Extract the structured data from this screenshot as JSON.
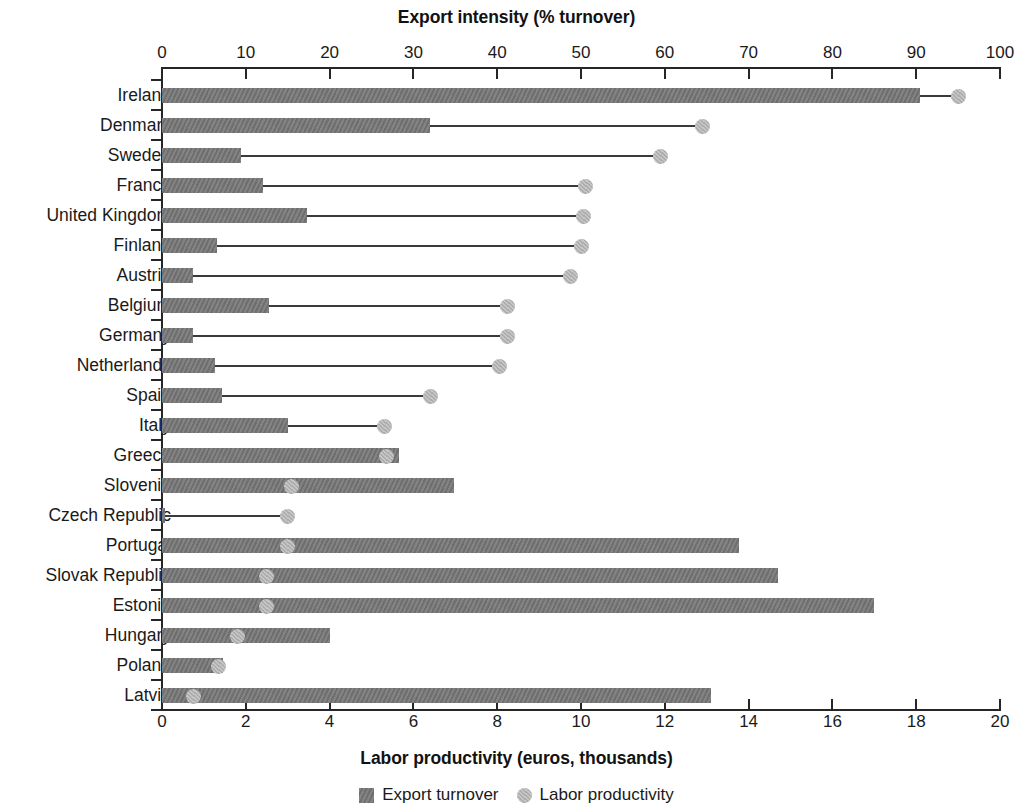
{
  "chart_data": {
    "type": "bar",
    "title": "",
    "top_axis": {
      "label": "Export intensity (% turnover)",
      "ticks": [
        0,
        10,
        20,
        30,
        40,
        50,
        60,
        70,
        80,
        90,
        100
      ],
      "range": [
        0,
        100
      ]
    },
    "bottom_axis": {
      "label": "Labor productivity (euros, thousands)",
      "ticks": [
        0,
        2,
        4,
        6,
        8,
        10,
        12,
        14,
        16,
        18,
        20
      ],
      "range": [
        0,
        20
      ]
    },
    "categories": [
      "Ireland",
      "Denmark",
      "Sweden",
      "France",
      "United Kingdom",
      "Finland",
      "Austria",
      "Belgium",
      "Germany",
      "Netherlands",
      "Spain",
      "Italy",
      "Greece",
      "Slovenia",
      "Czech Republic",
      "Portugal",
      "Slovak Republic",
      "Estonia",
      "Hungary",
      "Poland",
      "Latvia"
    ],
    "series": [
      {
        "name": "Export turnover",
        "unit": "% turnover",
        "axis": "top",
        "color": "#757575",
        "marker": "square",
        "values": [
          90.5,
          32.0,
          9.4,
          12.0,
          17.3,
          6.6,
          3.7,
          12.8,
          3.7,
          6.3,
          7.2,
          15.0,
          28.3,
          34.9,
          0.4,
          68.9,
          73.5,
          85.0,
          20.0,
          7.3,
          65.5
        ]
      },
      {
        "name": "Labor productivity",
        "unit": "euros, thousands",
        "axis": "bottom",
        "color": "#b6b6b6",
        "marker": "circle",
        "values": [
          19.0,
          12.9,
          11.9,
          10.1,
          10.05,
          10.0,
          9.75,
          8.25,
          8.25,
          8.05,
          6.4,
          5.3,
          5.35,
          3.1,
          3.0,
          3.0,
          2.5,
          2.5,
          1.8,
          1.35,
          0.75
        ]
      }
    ],
    "legend": {
      "position": "bottom-center",
      "entries": [
        {
          "label": "Export turnover",
          "marker": "square",
          "color": "#757575"
        },
        {
          "label": "Labor productivity",
          "marker": "circle",
          "color": "#b6b6b6"
        }
      ]
    },
    "grid": false
  },
  "geometry": {
    "plot_left_px": 162,
    "plot_right_px": 1000,
    "plot_top_px": 80,
    "plot_bottom_px": 711,
    "row_height_px": 30
  }
}
